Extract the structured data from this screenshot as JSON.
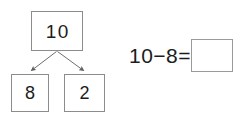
{
  "worksheet": {
    "number_bond": {
      "whole": "10",
      "part_left": "8",
      "part_right": "2",
      "arrow_left_name": "arrow-whole-to-part-left",
      "arrow_right_name": "arrow-whole-to-part-right"
    },
    "equation": {
      "expression": "10−8=",
      "answer_value": "",
      "answer_placeholder": ""
    },
    "colors": {
      "box_border": "#8c8c8c",
      "answer_border": "#9a9a9a",
      "text": "#1c1c1c",
      "arrow": "#6e6e6e",
      "background": "#ffffff"
    }
  }
}
